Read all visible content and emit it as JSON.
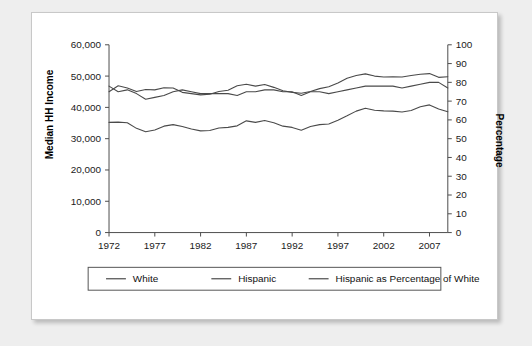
{
  "card": {
    "background": "#ffffff",
    "page_background": "#eeeeee"
  },
  "axis_titles": {
    "left": "Median HH Income",
    "right": "Percentage"
  },
  "legend": {
    "items": [
      {
        "label": "White",
        "color": "#4a4a4a"
      },
      {
        "label": "Hispanic",
        "color": "#4a4a4a"
      },
      {
        "label": "Hispanic as Percentage of White",
        "color": "#4a4a4a"
      }
    ]
  },
  "chart_data": {
    "type": "line",
    "title": "",
    "subtitle": "",
    "xlabel": "",
    "ylabel": "Median HH Income",
    "y2label": "Percentage",
    "xlim": [
      1972,
      2009
    ],
    "ylim": [
      0,
      60000
    ],
    "y2lim": [
      0,
      100
    ],
    "grid": false,
    "legend_position": "bottom",
    "xticks": [
      1972,
      1977,
      1982,
      1987,
      1992,
      1997,
      2002,
      2007
    ],
    "xtick_labels": [
      "1972",
      "1977",
      "1982",
      "1987",
      "1992",
      "1997",
      "2002",
      "2007"
    ],
    "yticks": [
      0,
      10000,
      20000,
      30000,
      40000,
      50000,
      60000
    ],
    "ytick_labels": [
      "0",
      "10,000",
      "20,000",
      "30,000",
      "40,000",
      "50,000",
      "60,000"
    ],
    "y2ticks": [
      0,
      10,
      20,
      30,
      40,
      50,
      60,
      70,
      80,
      90,
      100
    ],
    "y2tick_labels": [
      "0",
      "10",
      "20",
      "30",
      "40",
      "50",
      "60",
      "70",
      "80",
      "90",
      "100"
    ],
    "x": [
      1972,
      1973,
      1974,
      1975,
      1976,
      1977,
      1978,
      1979,
      1980,
      1981,
      1982,
      1983,
      1984,
      1985,
      1986,
      1987,
      1988,
      1989,
      1990,
      1991,
      1992,
      1993,
      1994,
      1995,
      1996,
      1997,
      1998,
      1999,
      2000,
      2001,
      2002,
      2003,
      2004,
      2005,
      2006,
      2007,
      2008,
      2009
    ],
    "series": [
      {
        "name": "White",
        "axis": "left",
        "color": "#4a4a4a",
        "values": [
          45000,
          46900,
          46200,
          45100,
          45700,
          45600,
          46300,
          46200,
          44800,
          44400,
          44000,
          44200,
          45100,
          45500,
          46900,
          47400,
          46800,
          47300,
          46400,
          45300,
          44800,
          44500,
          45100,
          46000,
          46600,
          47800,
          49300,
          50200,
          50700,
          50000,
          49700,
          49800,
          49700,
          50200,
          50600,
          50800,
          49600,
          49800
        ]
      },
      {
        "name": "Hispanic",
        "axis": "left",
        "color": "#4a4a4a",
        "values": [
          35200,
          35300,
          35100,
          33300,
          32200,
          32800,
          34000,
          34500,
          33900,
          33100,
          32500,
          32600,
          33400,
          33600,
          34100,
          35700,
          35200,
          35800,
          35100,
          34000,
          33600,
          32700,
          33900,
          34500,
          34700,
          35900,
          37300,
          38800,
          39700,
          39100,
          38900,
          38800,
          38500,
          39000,
          40200,
          40800,
          39500,
          38600
        ]
      },
      {
        "name": "Hispanic as Percentage of White",
        "axis": "right",
        "color": "#4a4a4a",
        "values": [
          78,
          75,
          76,
          74,
          71,
          72,
          73,
          75,
          76,
          75,
          74,
          74,
          74,
          74,
          73,
          75,
          75,
          76,
          76,
          75,
          75,
          73,
          75,
          75,
          74,
          75,
          76,
          77,
          78,
          78,
          78,
          78,
          77,
          78,
          79,
          80,
          80,
          77
        ]
      }
    ]
  }
}
